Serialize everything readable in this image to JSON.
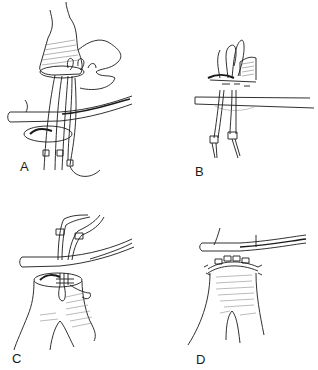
{
  "figure": {
    "type": "surgical illustration",
    "panels": [
      {
        "id": "A",
        "label": "A",
        "description": "Vessel end above rod with sutures passed through a cuff ring, pledgets on suture ends"
      },
      {
        "id": "B",
        "label": "B",
        "description": "Side view of anastomosis over rod with two pledgeted sutures hanging below"
      },
      {
        "id": "C",
        "label": "C",
        "description": "Bifurcated graft under rod with sutures and pledgets tied above the rod"
      },
      {
        "id": "D",
        "label": "D",
        "description": "Completed anastomosis with interrupted pledgeted sutures along the rim below the rod"
      }
    ]
  },
  "colors": {
    "ink": "#1a1a1a",
    "background": "#ffffff",
    "hatch": "#555555"
  }
}
